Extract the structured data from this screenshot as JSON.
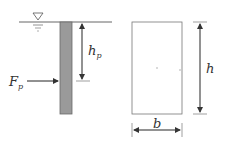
{
  "left_figure": {
    "water_symbol": "water-level-triangle",
    "force_label": "F",
    "force_sub": "p",
    "depth_label": "h",
    "depth_sub": "p"
  },
  "right_figure": {
    "height_label": "h",
    "width_label": "b"
  },
  "colors": {
    "pile_fill": "#9a9a9a",
    "line": "#555555"
  }
}
